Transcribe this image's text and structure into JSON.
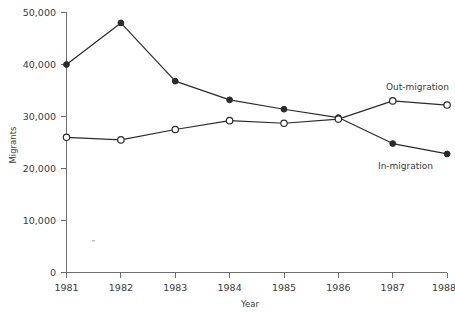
{
  "chart_data": {
    "type": "line",
    "title": "",
    "xlabel": "Year",
    "ylabel": "Migrants",
    "categories": [
      "1981",
      "1982",
      "1983",
      "1984",
      "1985",
      "1986",
      "1987",
      "1988"
    ],
    "x": [
      1981,
      1982,
      1983,
      1984,
      1985,
      1986,
      1987,
      1988
    ],
    "xlim": [
      1981,
      1988
    ],
    "ylim": [
      0,
      50000
    ],
    "ytick_labels": [
      "0",
      "10,000",
      "20,000",
      "30,000",
      "40,000",
      "50,000"
    ],
    "ytick_values": [
      0,
      10000,
      20000,
      30000,
      40000,
      50000
    ],
    "xtick_labels": [
      "1981",
      "1982",
      "1983",
      "1984",
      "1985",
      "1986",
      "1987",
      "1988"
    ],
    "grid": false,
    "legend_position": "inline-annotation",
    "series": [
      {
        "name": "Out-migration",
        "marker": "open-circle",
        "color": "#2b2b2b",
        "annotation": "Out-migration",
        "values": [
          26000,
          25500,
          27500,
          29200,
          28700,
          29500,
          33000,
          32200
        ]
      },
      {
        "name": "In-migration",
        "marker": "filled-circle",
        "color": "#2b2b2b",
        "annotation": "In-migration",
        "values": [
          40000,
          48000,
          36800,
          33200,
          31400,
          29800,
          24800,
          22800
        ]
      }
    ]
  },
  "axes": {
    "y_axis_title": "Migrants",
    "x_axis_title": "Year"
  },
  "annotations": {
    "out_migration_label": "Out-migration",
    "in_migration_label": "In-migration"
  },
  "colors": {
    "ink": "#2b2b2b",
    "axis": "#6e6e6e",
    "background": "#ffffff"
  }
}
